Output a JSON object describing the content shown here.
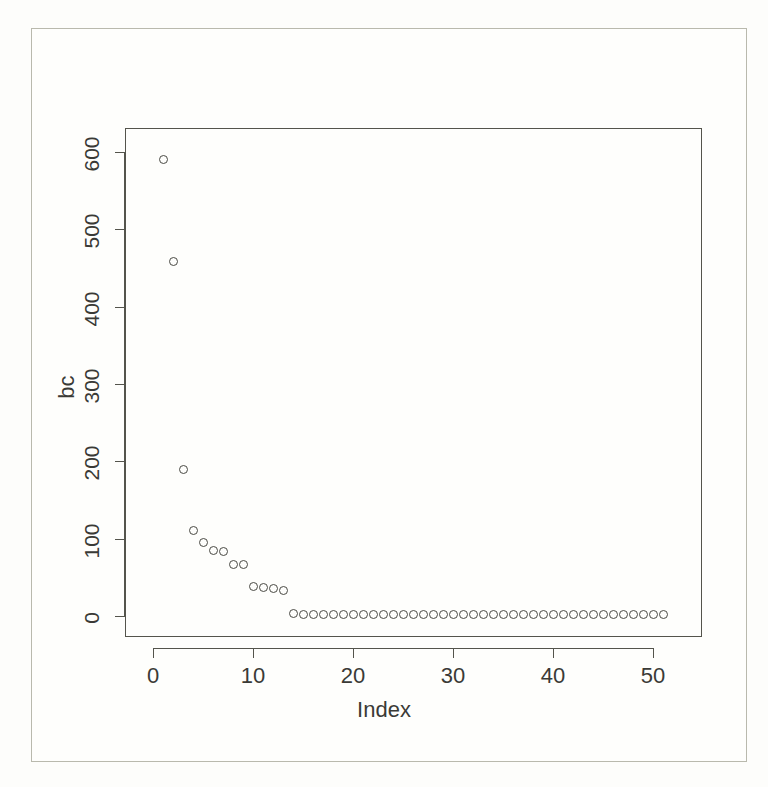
{
  "figure": {
    "background_color": "#fdfdfb",
    "frame_color": "#b9b9ad",
    "axis_color": "#54544c",
    "point_color": "#4a4a44"
  },
  "chart_data": {
    "type": "scatter",
    "title": "",
    "xlabel": "Index",
    "ylabel": "bc",
    "xlim": [
      0,
      52
    ],
    "ylim": [
      0,
      620
    ],
    "xticks": [
      0,
      10,
      20,
      30,
      40,
      50
    ],
    "yticks": [
      0,
      100,
      200,
      300,
      400,
      500,
      600
    ],
    "xtick_labels": [
      "0",
      "10",
      "20",
      "30",
      "40",
      "50"
    ],
    "ytick_labels": [
      "0",
      "100",
      "200",
      "300",
      "400",
      "500",
      "600"
    ],
    "grid": false,
    "legend": null,
    "marker": "open-circle",
    "marker_size": 9,
    "x": [
      1,
      2,
      3,
      4,
      5,
      6,
      7,
      8,
      9,
      10,
      11,
      12,
      13,
      14,
      15,
      16,
      17,
      18,
      19,
      20,
      21,
      22,
      23,
      24,
      25,
      26,
      27,
      28,
      29,
      30,
      31,
      32,
      33,
      34,
      35,
      36,
      37,
      38,
      39,
      40,
      41,
      42,
      43,
      44,
      45,
      46,
      47,
      48,
      49,
      50,
      51
    ],
    "y": [
      590,
      458,
      190,
      110,
      95,
      85,
      83,
      67,
      66,
      38,
      37,
      36,
      33,
      3,
      2,
      2,
      2,
      2,
      2,
      2,
      2,
      2,
      2,
      2,
      2,
      2,
      2,
      2,
      2,
      2,
      2,
      2,
      2,
      2,
      2,
      2,
      2,
      2,
      2,
      2,
      2,
      2,
      2,
      2,
      2,
      2,
      2,
      2,
      2,
      2,
      2
    ],
    "n_points": 51
  }
}
